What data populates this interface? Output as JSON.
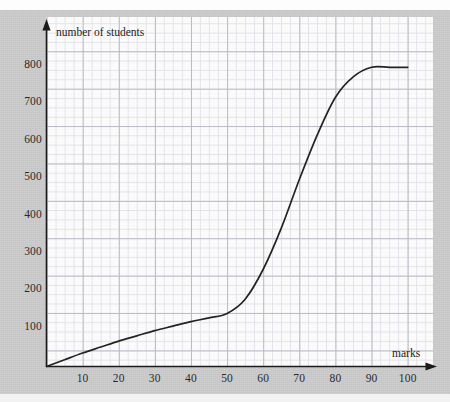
{
  "chart_data": {
    "type": "line",
    "title": "",
    "subtitle": "",
    "xlabel": "marks",
    "ylabel": "number of students",
    "xlim": [
      0,
      104
    ],
    "ylim": [
      0,
      860
    ],
    "grid": "major and minor graph-paper grid",
    "legend": "none",
    "x_ticks": [
      10,
      20,
      30,
      40,
      50,
      60,
      70,
      80,
      90,
      100
    ],
    "x_tick_labels": [
      "10",
      "20",
      "30",
      "40",
      "50",
      "60",
      "70",
      "80",
      "90",
      "100"
    ],
    "y_ticks": [
      100,
      200,
      300,
      400,
      500,
      600,
      700,
      800
    ],
    "y_tick_labels": [
      "100",
      "200",
      "300",
      "400",
      "500",
      "600",
      "700",
      "800"
    ],
    "series": [
      {
        "name": "cumulative frequency",
        "x": [
          0,
          5,
          10,
          15,
          20,
          25,
          30,
          35,
          40,
          45,
          50,
          55,
          60,
          65,
          70,
          75,
          80,
          85,
          90,
          95,
          100
        ],
        "values": [
          0,
          18,
          36,
          52,
          68,
          82,
          96,
          108,
          120,
          130,
          142,
          180,
          260,
          370,
          500,
          620,
          720,
          775,
          800,
          800,
          800
        ]
      }
    ],
    "axis_style": "arrow-headed axes with origin at bottom-left",
    "annotations": []
  },
  "axes": {
    "y_title": "number of students",
    "x_title": "marks"
  },
  "colors": {
    "curve": "#232323",
    "axis": "#1b1b1b",
    "grid_major": "#b9bac6",
    "grid_minor": "#e2e2ea",
    "panel_background": "#fbfbfb",
    "page_background": "#c9c9c9",
    "text": "#2a2a2a"
  }
}
